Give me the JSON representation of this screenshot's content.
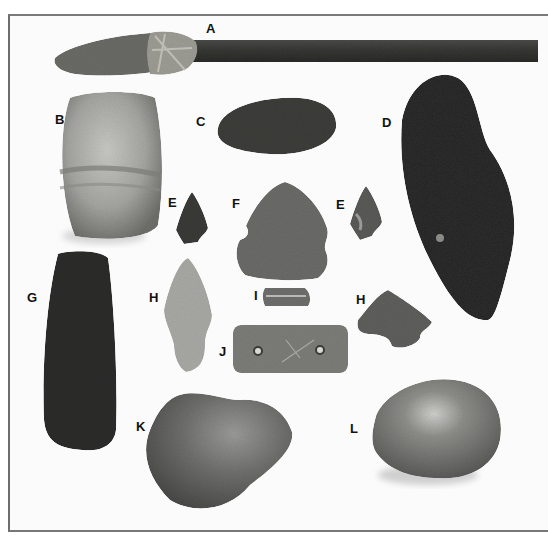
{
  "figure": {
    "colors": {
      "background": "#fbfbfb",
      "frame": "#707070",
      "dark_stone": "#2a2a2a",
      "mid_stone": "#6a6a6a",
      "light_stone": "#a8a8a8",
      "shaft": "#3a3a3a",
      "binding": "#9a9a90"
    },
    "labels": {
      "A": "A",
      "B": "B",
      "C": "C",
      "D": "D",
      "E_left": "E",
      "E_right": "E",
      "F": "F",
      "G": "G",
      "H_left": "H",
      "H_right": "H",
      "I": "I",
      "J": "J",
      "K": "K",
      "L": "L"
    },
    "artifacts": [
      {
        "label": "A",
        "shape": "hafted spear point on wooden shaft with fiber binding"
      },
      {
        "label": "B",
        "shape": "grooved stone block"
      },
      {
        "label": "C",
        "shape": "oval flaked blade"
      },
      {
        "label": "D",
        "shape": "large dark polished pestle-like stone"
      },
      {
        "label": "E",
        "shape": "small notched arrowheads (two)"
      },
      {
        "label": "F",
        "shape": "large notched point"
      },
      {
        "label": "G",
        "shape": "dark ground stone celt"
      },
      {
        "label": "H",
        "shape": "stemmed point and notched arrowhead"
      },
      {
        "label": "I",
        "shape": "small grooved bead"
      },
      {
        "label": "J",
        "shape": "two-hole gorget"
      },
      {
        "label": "K",
        "shape": "rounded hammerstone"
      },
      {
        "label": "L",
        "shape": "oval pitted stone"
      }
    ]
  }
}
